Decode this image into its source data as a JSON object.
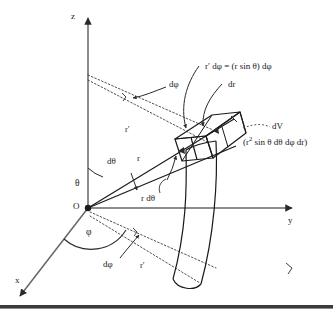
{
  "figure": {
    "axes": [
      {
        "name": "z-axis",
        "label": "z"
      },
      {
        "name": "y-axis",
        "label": "y"
      },
      {
        "name": "x-axis",
        "label": "x"
      }
    ],
    "origin_label": "O",
    "annotations": {
      "theta": "θ",
      "phi": "φ",
      "d_theta": "dθ",
      "d_phi_upper": "dφ",
      "d_phi_lower": "dφ",
      "r_ray": "r",
      "r_arc": "r dθ",
      "r_prime_upper": "r′",
      "r_prime_lower": "r′",
      "r_prime_dphi": "r′ dφ  = (r sin θ) dφ",
      "dr": "dr",
      "dV": "dV",
      "dV_expression_pre": "(r",
      "dV_expression_sup": "2",
      "dV_expression_post": " sin θ dθ dφ dr)"
    },
    "colors": {
      "ink": "#1a1a1a",
      "axis": "#5a5a5a",
      "background": "#ffffff",
      "rule": "#3b3b3b"
    }
  }
}
